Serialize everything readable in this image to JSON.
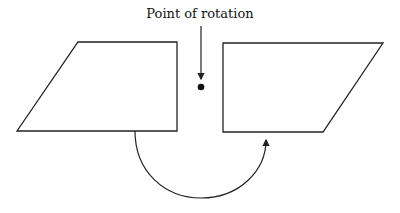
{
  "diagram": {
    "label": "Point of rotation",
    "shapes": [
      {
        "name": "original-shape",
        "type": "trapezoid"
      },
      {
        "name": "rotated-shape",
        "type": "trapezoid"
      }
    ],
    "stroke_color": "#222222"
  }
}
